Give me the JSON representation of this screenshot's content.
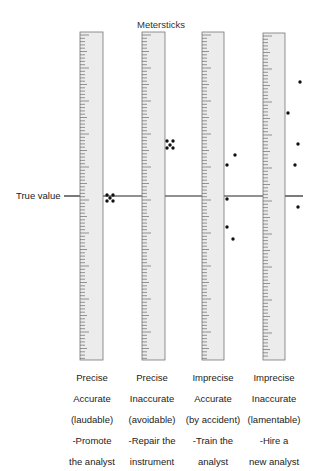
{
  "title": "Metersticks",
  "true_value_label": "True value",
  "true_value_y": 196,
  "colors": {
    "ruler_fill": "#ececec",
    "ruler_edge": "#777777",
    "tick": "#555555",
    "line": "#222222",
    "dot": "#111111"
  },
  "rulers": [
    {
      "x": 80,
      "width": 23,
      "top": 32,
      "bottom": 360,
      "caption": [
        "Precise",
        "Accurate",
        "(laudable)",
        "-Promote",
        "the analyst"
      ],
      "dots": [
        [
          107,
          195
        ],
        [
          113,
          195
        ],
        [
          110,
          198
        ],
        [
          107,
          201
        ],
        [
          113,
          201
        ]
      ]
    },
    {
      "x": 142,
      "width": 23,
      "top": 32,
      "bottom": 360,
      "caption": [
        "Precise",
        "Inaccurate",
        "(avoidable)",
        "-Repair the",
        "instrument"
      ],
      "dots": [
        [
          167,
          141
        ],
        [
          173,
          141
        ],
        [
          170,
          145
        ],
        [
          167,
          148
        ],
        [
          173,
          148
        ]
      ]
    },
    {
      "x": 202,
      "width": 22,
      "top": 32,
      "bottom": 360,
      "caption": [
        "Imprecise",
        "Accurate",
        "(by accident)",
        "-Train the",
        "analyst"
      ],
      "dots": [
        [
          235,
          155
        ],
        [
          227,
          165
        ],
        [
          227,
          199
        ],
        [
          227,
          227
        ],
        [
          233,
          239
        ]
      ]
    },
    {
      "x": 263,
      "width": 22,
      "top": 33,
      "bottom": 360,
      "caption": [
        "Imprecise",
        "Inaccurate",
        "(lamentable)",
        "-Hire a",
        "new analyst"
      ],
      "dots": [
        [
          300,
          82
        ],
        [
          288,
          113
        ],
        [
          298,
          144
        ],
        [
          295,
          165
        ],
        [
          298,
          207
        ]
      ]
    }
  ]
}
